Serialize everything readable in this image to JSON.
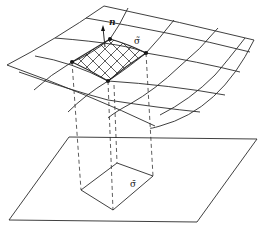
{
  "figure": {
    "labels": {
      "normal": "n",
      "surface_element": "σ̃",
      "projected_element": "σ̄"
    },
    "colors": {
      "stroke": "#2a2a2a",
      "background": "#ffffff"
    }
  }
}
